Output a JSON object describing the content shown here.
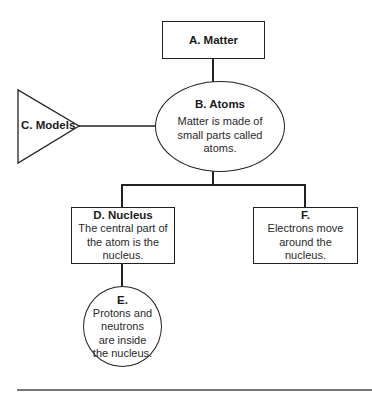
{
  "diagram": {
    "nodes": {
      "A": {
        "shape": "rectangle",
        "title": "A. Matter",
        "text": ""
      },
      "B": {
        "shape": "ellipse",
        "title": "B. Atoms",
        "text": "Matter is made of small parts called atoms."
      },
      "C": {
        "shape": "triangle",
        "title": "C. Models",
        "text": ""
      },
      "D": {
        "shape": "rectangle",
        "title": "D. Nucleus",
        "text": "The central part of the atom is the nucleus."
      },
      "E": {
        "shape": "circle",
        "title": "E.",
        "text": "Protons and neutrons are inside the nucleus."
      },
      "F": {
        "shape": "rectangle",
        "title": "F.",
        "text": "Electrons move around the nucleus."
      }
    },
    "edges": [
      {
        "from": "A",
        "to": "B"
      },
      {
        "from": "C",
        "to": "B"
      },
      {
        "from": "B",
        "to": "D"
      },
      {
        "from": "B",
        "to": "F"
      },
      {
        "from": "D",
        "to": "E"
      }
    ],
    "colors": {
      "stroke": "#222222",
      "rule": "#777777",
      "background": "#ffffff"
    }
  }
}
